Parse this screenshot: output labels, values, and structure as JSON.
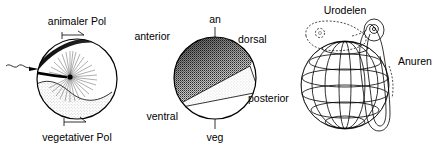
{
  "figure": {
    "title_present": false,
    "panels": [
      {
        "id": "panel-a",
        "name": "fertilized-egg-polarity",
        "labels": {
          "animal_pole": "animaler Pol",
          "vegetal_pole": "vegetativer Pol"
        },
        "features": {
          "sperm": "sperm-entry",
          "aster": "sperm-aster",
          "cortex": "dark-cortex-band",
          "yolk": "stippled-vegetal-yolk",
          "grey_crescent": "grey-crescent"
        }
      },
      {
        "id": "panel-b",
        "name": "egg-axes-map",
        "labels": {
          "animal": "an",
          "vegetal": "veg",
          "anterior": "anterior",
          "posterior": "posterior",
          "dorsal": "dorsal",
          "ventral": "ventral"
        },
        "features": {
          "animal_cap": "dark-stippled-animal-hemisphere",
          "crescent": "grey-crescent-wedge",
          "vegetal": "white-vegetal-hemisphere"
        }
      },
      {
        "id": "panel-c",
        "name": "amphibian-larvae-comparison",
        "labels": {
          "urodeles": "Urodelen",
          "anurans": "Anuren"
        },
        "features": {
          "sphere": "gridded-egg-sphere",
          "urodele_larva": "urodele-larva-outline",
          "anuran_larva": "anuran-tadpole-outline"
        }
      }
    ]
  },
  "colors": {
    "ink": "#000000",
    "stipple_dark": "#1a1a1a",
    "stipple_mid": "#8a8a8a",
    "stipple_light": "#d4d4d4",
    "background": "#ffffff"
  }
}
